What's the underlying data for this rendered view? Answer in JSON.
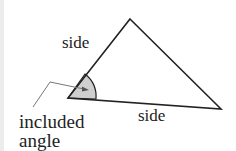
{
  "diagram": {
    "title": "",
    "labels": {
      "side_left": "side",
      "side_bottom": "side",
      "included_line1": "included",
      "included_line2": "angle"
    },
    "colors": {
      "stroke": "#222222",
      "angle_fill": "#cfcfcf",
      "leader": "#777777",
      "background": "#ffffff"
    },
    "vertices": {
      "apex": [
        130,
        19
      ],
      "left": [
        68,
        98
      ],
      "right": [
        221,
        109
      ]
    }
  }
}
